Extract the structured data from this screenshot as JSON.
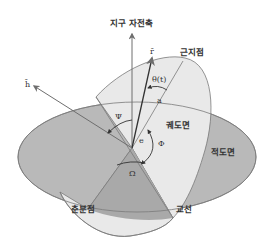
{
  "diagram": {
    "colors": {
      "background": "#ffffff",
      "equatorial_plane": "#b9b9b9",
      "equatorial_plane_dark": "#a9a9a9",
      "orbital_plane": "#e9e9e9",
      "outline": "#7a7a7a",
      "arrow": "#6e6e6e",
      "text": "#333333"
    },
    "labels": {
      "earth_axis": "지구 자전축",
      "perigee": "근지점",
      "orbital_plane": "궤도면",
      "equatorial_plane": "적도면",
      "vernal_equinox": "춘분점",
      "line_of_nodes": "교선"
    },
    "symbols": {
      "position_vector": "r̄",
      "angular_momentum": "h̄",
      "true_anomaly": "θ(t)",
      "semi_major_axis": "a",
      "eccentricity": "e",
      "inclination": "Ψ",
      "argument_of_perigee": "Φ",
      "ascending_node": "Ω"
    }
  }
}
